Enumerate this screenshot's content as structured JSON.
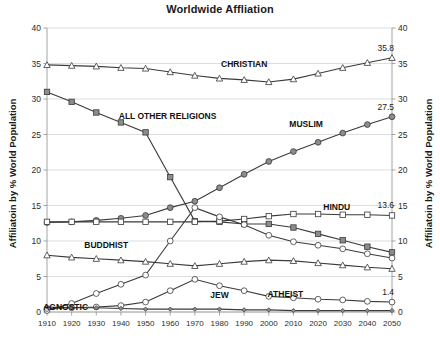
{
  "chart_data": {
    "type": "line",
    "title": "Worldwide Affliation",
    "xlabel": "",
    "ylabel": "Affiliatoin by % World Population",
    "ylabel_right": "Affiliatoin by % World Population",
    "ylim": [
      0,
      40
    ],
    "yticks": [
      0,
      5,
      10,
      15,
      20,
      25,
      30,
      35,
      40
    ],
    "grid": true,
    "legend_position": "inline-labels",
    "categories": [
      1910,
      1920,
      1930,
      1940,
      1950,
      1960,
      1970,
      1980,
      1990,
      2000,
      2010,
      2020,
      2030,
      2040,
      2050
    ],
    "series": [
      {
        "name": "CHRISTIAN",
        "marker": "open-triangle",
        "label_x": 1990,
        "end_label": "35.8",
        "values": [
          34.8,
          34.7,
          34.6,
          34.4,
          34.3,
          33.8,
          33.3,
          32.9,
          32.7,
          32.4,
          32.8,
          33.6,
          34.4,
          35.1,
          35.8
        ]
      },
      {
        "name": "ALL OTHER RELIGIONS",
        "marker": "filled-square",
        "label_x": 1950,
        "end_label": "",
        "values": [
          31.0,
          29.6,
          28.1,
          26.7,
          25.3,
          19.0,
          12.8,
          12.7,
          12.4,
          12.4,
          11.9,
          11.0,
          10.1,
          9.2,
          8.4
        ]
      },
      {
        "name": "MUSLIM",
        "marker": "filled-circle",
        "label_x": 2020,
        "end_label": "27.5",
        "values": [
          12.6,
          12.7,
          12.9,
          13.2,
          13.6,
          14.7,
          15.6,
          17.5,
          19.4,
          21.2,
          22.6,
          23.9,
          25.2,
          26.4,
          27.5
        ]
      },
      {
        "name": "HINDU",
        "marker": "open-square",
        "label_x": 2030,
        "end_label": "13.6",
        "values": [
          12.7,
          12.7,
          12.7,
          12.7,
          12.7,
          12.7,
          12.7,
          12.8,
          13.1,
          13.5,
          13.8,
          13.8,
          13.7,
          13.7,
          13.6
        ]
      },
      {
        "name": "BUDDHIST",
        "marker": "open-triangle",
        "label_x": 1930,
        "end_label": "",
        "values": [
          8.0,
          7.7,
          7.5,
          7.3,
          7.1,
          6.8,
          6.5,
          6.8,
          7.1,
          7.3,
          7.2,
          6.9,
          6.6,
          6.3,
          6.1
        ]
      },
      {
        "name": "AGNOSTIC",
        "marker": "open-circle",
        "label_x": 1920,
        "end_label": "",
        "values": [
          0.2,
          1.2,
          2.6,
          3.9,
          5.2,
          10.0,
          14.7,
          13.4,
          12.3,
          10.8,
          9.9,
          9.4,
          8.9,
          8.2,
          7.6
        ]
      },
      {
        "name": "ATHEIST",
        "marker": "open-circle",
        "label_x": 2010,
        "end_label": "1.4",
        "values": [
          0.5,
          0.6,
          0.7,
          0.9,
          1.4,
          3.0,
          4.6,
          3.7,
          3.0,
          2.2,
          2.0,
          1.8,
          1.7,
          1.5,
          1.4
        ]
      },
      {
        "name": "JEW",
        "marker": "small-diamond",
        "label_x": 1980,
        "end_label": "",
        "values": [
          0.7,
          0.6,
          0.6,
          0.5,
          0.4,
          0.4,
          0.4,
          0.4,
          0.3,
          0.3,
          0.2,
          0.2,
          0.2,
          0.2,
          0.2
        ]
      }
    ]
  },
  "colors": {
    "line": "#3a3a3a",
    "grid": "#d4d4d4",
    "axis": "#9a9a9a",
    "marker_fill_light": "#ffffff",
    "marker_fill_dark": "#8c8c8c",
    "text": "#1a1a1a",
    "background": "#ffffff"
  }
}
